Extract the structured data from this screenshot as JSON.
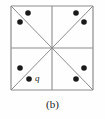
{
  "figure": {
    "caption": "(b)",
    "charge_label": "q",
    "colors": {
      "background": "#fefefe",
      "line": "#8c8c8c",
      "border": "#8c8c8c",
      "dot": "#1a1a1a",
      "text": "#1a1a1a"
    },
    "square": {
      "x": 11,
      "y": 6,
      "width": 82,
      "height": 84
    },
    "lines": [
      {
        "name": "border-top",
        "x1": 11,
        "y1": 6,
        "x2": 93,
        "y2": 6
      },
      {
        "name": "border-right",
        "x1": 93,
        "y1": 6,
        "x2": 93,
        "y2": 90
      },
      {
        "name": "border-bottom",
        "x1": 93,
        "y1": 90,
        "x2": 11,
        "y2": 90
      },
      {
        "name": "border-left",
        "x1": 11,
        "y1": 90,
        "x2": 11,
        "y2": 6
      },
      {
        "name": "midline-horizontal",
        "x1": 11,
        "y1": 48,
        "x2": 93,
        "y2": 48
      },
      {
        "name": "midline-vertical",
        "x1": 52,
        "y1": 6,
        "x2": 52,
        "y2": 90
      },
      {
        "name": "diagonal-tl-br",
        "x1": 11,
        "y1": 6,
        "x2": 93,
        "y2": 90
      },
      {
        "name": "diagonal-tr-bl",
        "x1": 93,
        "y1": 6,
        "x2": 11,
        "y2": 90
      }
    ],
    "dots": [
      {
        "name": "charge-top-left-outer",
        "cx": 28,
        "cy": 13,
        "r": 2.8
      },
      {
        "name": "charge-top-left-inner",
        "cx": 20,
        "cy": 22,
        "r": 2.8
      },
      {
        "name": "charge-top-right-inner",
        "cx": 76,
        "cy": 13,
        "r": 2.8
      },
      {
        "name": "charge-top-right-outer",
        "cx": 84,
        "cy": 22,
        "r": 2.8
      },
      {
        "name": "charge-bottom-left-outer",
        "cx": 20,
        "cy": 68,
        "r": 2.8
      },
      {
        "name": "charge-bottom-left-inner",
        "cx": 29,
        "cy": 79,
        "r": 2.8
      },
      {
        "name": "charge-bottom-right-outer",
        "cx": 84,
        "cy": 68,
        "r": 2.8
      },
      {
        "name": "charge-bottom-right-inner",
        "cx": 76,
        "cy": 79,
        "r": 2.8
      }
    ]
  }
}
